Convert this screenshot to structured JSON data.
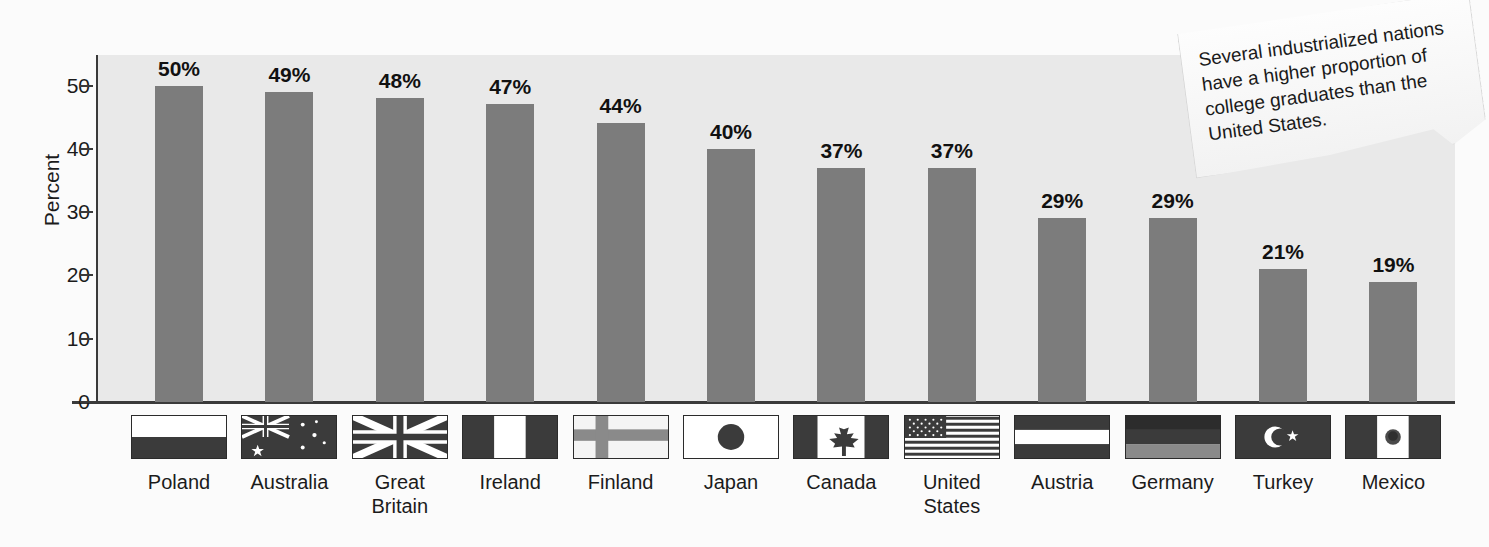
{
  "chart_data": {
    "type": "bar",
    "title": "",
    "xlabel": "",
    "ylabel": "Percent",
    "ylim": [
      0,
      55
    ],
    "yticks": [
      0,
      10,
      20,
      30,
      40,
      50
    ],
    "grid": false,
    "legend": "none",
    "categories": [
      "Poland",
      "Australia",
      "Great Britain",
      "Ireland",
      "Finland",
      "Japan",
      "Canada",
      "United States",
      "Austria",
      "Germany",
      "Turkey",
      "Mexico"
    ],
    "category_lines": [
      [
        "Poland"
      ],
      [
        "Australia"
      ],
      [
        "Great",
        "Britain"
      ],
      [
        "Ireland"
      ],
      [
        "Finland"
      ],
      [
        "Japan"
      ],
      [
        "Canada"
      ],
      [
        "United",
        "States"
      ],
      [
        "Austria"
      ],
      [
        "Germany"
      ],
      [
        "Turkey"
      ],
      [
        "Mexico"
      ]
    ],
    "values": [
      50,
      49,
      48,
      47,
      44,
      40,
      37,
      37,
      29,
      29,
      21,
      19
    ],
    "value_labels": [
      "50%",
      "49%",
      "48%",
      "47%",
      "44%",
      "40%",
      "37%",
      "37%",
      "29%",
      "29%",
      "21%",
      "19%"
    ],
    "flags": [
      "poland-flag",
      "australia-flag",
      "great-britain-flag",
      "ireland-flag",
      "finland-flag",
      "japan-flag",
      "canada-flag",
      "united-states-flag",
      "austria-flag",
      "germany-flag",
      "turkey-flag",
      "mexico-flag"
    ],
    "annotation": "Several industrialized nations have a higher proportion of college graduates than the United States."
  },
  "colors": {
    "bar": "#7c7c7c",
    "plot_background": "#e9e9e9",
    "page_background": "#fbfbfb",
    "axis": "#3a3a3a",
    "text": "#1b1b1b"
  },
  "callout": {
    "text": "Several industrialized nations have a higher proportion of college graduates than the United States."
  }
}
